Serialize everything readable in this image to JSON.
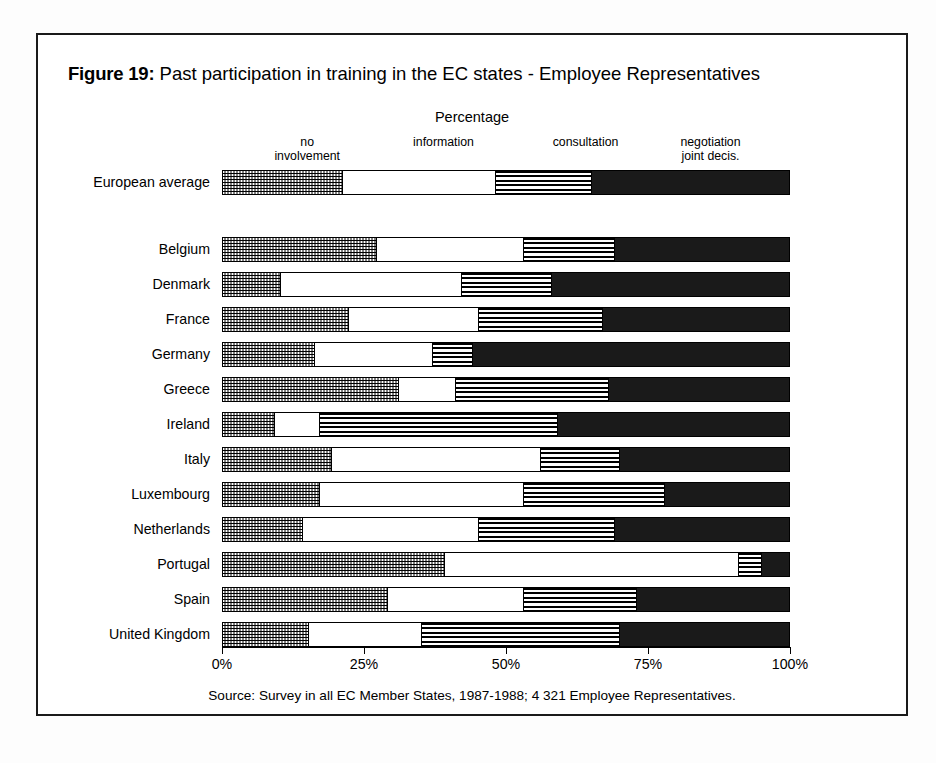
{
  "figure": {
    "label": "Figure 19:",
    "title": "Past participation in training in the EC states - Employee Representatives",
    "axis_title": "Percentage",
    "source": "Source: Survey in all EC Member States, 1987-1988; 4 321 Employee Representatives."
  },
  "chart_data": {
    "type": "bar",
    "orientation": "horizontal",
    "stacked": true,
    "normalized_percent": true,
    "title": "Past participation in training in the EC states - Employee Representatives",
    "xlabel": "Percentage",
    "ylabel": "",
    "xlim": [
      0,
      100
    ],
    "xticks": [
      0,
      25,
      50,
      75,
      100
    ],
    "xticklabels": [
      "0%",
      "25%",
      "50%",
      "75%",
      "100%"
    ],
    "grid": false,
    "legend_position": "top (segment column headers)",
    "series": [
      {
        "name": "no involvement",
        "pattern": "dots",
        "values": [
          21,
          27,
          10,
          22,
          16,
          31,
          9,
          19,
          17,
          14,
          39,
          29,
          15
        ]
      },
      {
        "name": "information",
        "pattern": "white",
        "values": [
          27,
          26,
          32,
          23,
          21,
          10,
          8,
          37,
          36,
          31,
          52,
          24,
          20
        ]
      },
      {
        "name": "consultation",
        "pattern": "hlines",
        "values": [
          17,
          16,
          16,
          22,
          7,
          27,
          42,
          14,
          25,
          24,
          4,
          20,
          35
        ]
      },
      {
        "name": "negotiation joint decis.",
        "pattern": "black",
        "values": [
          35,
          31,
          42,
          33,
          56,
          32,
          41,
          30,
          22,
          31,
          5,
          27,
          30
        ]
      }
    ],
    "categories": [
      "European average",
      "Belgium",
      "Denmark",
      "France",
      "Germany",
      "Greece",
      "Ireland",
      "Italy",
      "Luxembourg",
      "Netherlands",
      "Portugal",
      "Spain",
      "United Kingdom"
    ]
  },
  "segment_headers": [
    {
      "text": "no\ninvolvement",
      "center_pct": 15
    },
    {
      "text": "information",
      "center_pct": 39
    },
    {
      "text": "consultation",
      "center_pct": 64
    },
    {
      "text": "negotiation\njoint decis.",
      "center_pct": 86
    }
  ],
  "rows": [
    {
      "label": "European average",
      "top": 135,
      "segments": [
        21,
        27,
        17,
        35
      ]
    },
    {
      "label": "Belgium",
      "top": 202,
      "segments": [
        27,
        26,
        16,
        31
      ]
    },
    {
      "label": "Denmark",
      "top": 237,
      "segments": [
        10,
        32,
        16,
        42
      ]
    },
    {
      "label": "France",
      "top": 272,
      "segments": [
        22,
        23,
        22,
        33
      ]
    },
    {
      "label": "Germany",
      "top": 307,
      "segments": [
        16,
        21,
        7,
        56
      ]
    },
    {
      "label": "Greece",
      "top": 342,
      "segments": [
        31,
        10,
        27,
        32
      ]
    },
    {
      "label": "Ireland",
      "top": 377,
      "segments": [
        9,
        8,
        42,
        41
      ]
    },
    {
      "label": "Italy",
      "top": 412,
      "segments": [
        19,
        37,
        14,
        30
      ]
    },
    {
      "label": "Luxembourg",
      "top": 447,
      "segments": [
        17,
        36,
        25,
        22
      ]
    },
    {
      "label": "Netherlands",
      "top": 482,
      "segments": [
        14,
        31,
        24,
        31
      ]
    },
    {
      "label": "Portugal",
      "top": 517,
      "segments": [
        39,
        52,
        4,
        5
      ]
    },
    {
      "label": "Spain",
      "top": 552,
      "segments": [
        29,
        24,
        20,
        27
      ]
    },
    {
      "label": "United Kingdom",
      "top": 587,
      "segments": [
        15,
        20,
        35,
        30
      ]
    }
  ],
  "ticks": [
    {
      "label": "0%",
      "pct": 0
    },
    {
      "label": "25%",
      "pct": 25
    },
    {
      "label": "50%",
      "pct": 50
    },
    {
      "label": "75%",
      "pct": 75
    },
    {
      "label": "100%",
      "pct": 100
    }
  ]
}
